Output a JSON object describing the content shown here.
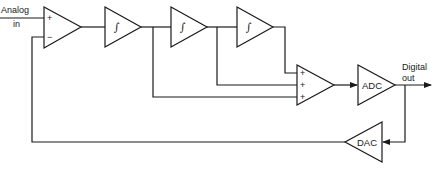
{
  "diagram": {
    "type": "block-diagram",
    "input": {
      "label_line1": "Analog",
      "label_line2": "in"
    },
    "output": {
      "label_line1": "Digital",
      "label_line2": "out"
    },
    "blocks": [
      {
        "id": "input-summer",
        "kind": "difference-amplifier",
        "inputs": [
          "+",
          "−"
        ]
      },
      {
        "id": "integrator-1",
        "kind": "integrator",
        "symbol": "∫"
      },
      {
        "id": "integrator-2",
        "kind": "integrator",
        "symbol": "∫"
      },
      {
        "id": "integrator-3",
        "kind": "integrator",
        "symbol": "∫"
      },
      {
        "id": "output-summer",
        "kind": "summing-amplifier",
        "inputs": [
          "+",
          "+",
          "+"
        ]
      },
      {
        "id": "adc",
        "kind": "converter",
        "label": "ADC"
      },
      {
        "id": "dac",
        "kind": "converter",
        "label": "DAC"
      }
    ],
    "connections": [
      "analog-in → input-summer(+)",
      "input-summer → integrator-1",
      "integrator-1 → integrator-2",
      "integrator-2 → integrator-3",
      "integrator-1 → output-summer(+3)",
      "integrator-2 → output-summer(+2)",
      "integrator-3 → output-summer(+1)",
      "output-summer → adc",
      "adc → digital-out",
      "digital-out → dac",
      "dac → input-summer(−)"
    ]
  },
  "labels": {
    "analog": "Analog",
    "in": "in",
    "digital": "Digital",
    "out": "out",
    "plus": "+",
    "minus": "−",
    "integral": "∫",
    "adc": "ADC",
    "dac": "DAC"
  }
}
